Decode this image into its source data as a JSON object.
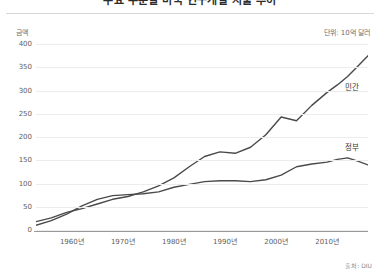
{
  "title": "주요 부문별 미국 연구개발 지출 추이",
  "axis_name": "금액",
  "unit_note": "단위: 10억 달러",
  "source": "출처: DIU",
  "labels": {
    "private": "민간",
    "government": "정부"
  },
  "colors": {
    "line": "#4a4a4a",
    "grid": "#ececec",
    "axis": "#9a9a9a",
    "text": "#5e5e5e"
  },
  "chart_data": {
    "type": "line",
    "title": "주요 부문별 미국 연구개발 지출 추이",
    "xlabel": "",
    "ylabel": "금액",
    "unit": "10억 달러",
    "grid": true,
    "legend": "inline-right",
    "xlim": [
      1953,
      2018
    ],
    "ylim": [
      0,
      400
    ],
    "yticks": [
      0,
      50,
      100,
      150,
      200,
      250,
      300,
      350,
      400
    ],
    "ytick_labels": [
      "0",
      "50",
      "100",
      "150",
      "200",
      "250",
      "300",
      "350",
      "400"
    ],
    "xticks": [
      1960,
      1970,
      1980,
      1990,
      2000,
      2010
    ],
    "xtick_labels": [
      "1960년",
      "1970년",
      "1980년",
      "1990년",
      "2000년",
      "2010년"
    ],
    "x": [
      1953,
      1956,
      1959,
      1962,
      1965,
      1968,
      1971,
      1974,
      1977,
      1980,
      1983,
      1986,
      1989,
      1992,
      1995,
      1998,
      2001,
      2004,
      2007,
      2010,
      2012,
      2014,
      2016,
      2018
    ],
    "series": [
      {
        "name": "민간",
        "label": "민간",
        "color": "#4a4a4a",
        "values": [
          18,
          26,
          38,
          46,
          56,
          66,
          72,
          82,
          95,
          112,
          136,
          158,
          168,
          165,
          178,
          205,
          243,
          235,
          268,
          296,
          312,
          330,
          352,
          375
        ]
      },
      {
        "name": "정부",
        "label": "정부",
        "color": "#4a4a4a",
        "values": [
          10,
          20,
          34,
          52,
          66,
          74,
          76,
          78,
          82,
          92,
          98,
          104,
          106,
          106,
          104,
          108,
          118,
          136,
          142,
          146,
          152,
          155,
          148,
          140
        ]
      }
    ]
  }
}
